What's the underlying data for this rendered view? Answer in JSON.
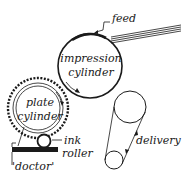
{
  "diagram": {
    "labels": {
      "feed": "feed",
      "impression_line1": "impression",
      "impression_line2": "cylinder",
      "plate_line1": "plate",
      "plate_line2": "cylinder",
      "ink_line1": "ink",
      "ink_line2": "roller",
      "doctor": "'doctor'",
      "delivery": "delivery"
    },
    "colors": {
      "ink": "#1a1a1a",
      "background": "#ffffff"
    }
  }
}
